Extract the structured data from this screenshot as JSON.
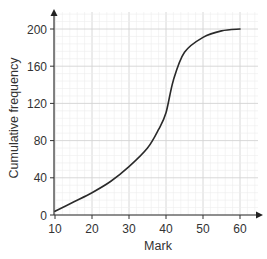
{
  "chart_data": {
    "type": "line",
    "title": "",
    "xlabel": "Mark",
    "ylabel": "Cumulative frequency",
    "xlim": [
      10,
      60
    ],
    "ylim": [
      0,
      200
    ],
    "x_ticks": [
      10,
      20,
      30,
      40,
      50,
      60
    ],
    "y_ticks": [
      0,
      40,
      80,
      120,
      160,
      200
    ],
    "grid": true,
    "legend": null,
    "series": [
      {
        "name": "Cumulative frequency",
        "x": [
          10,
          15,
          20,
          25,
          30,
          35,
          38,
          40,
          42,
          45,
          50,
          55,
          60
        ],
        "y": [
          4,
          14,
          24,
          36,
          52,
          72,
          92,
          110,
          145,
          175,
          191,
          198,
          200
        ]
      }
    ],
    "colors": {
      "line": "#2a2a2a",
      "axis": "#333333",
      "grid_major": "#d4d4d4",
      "grid_minor": "#ececec"
    }
  }
}
